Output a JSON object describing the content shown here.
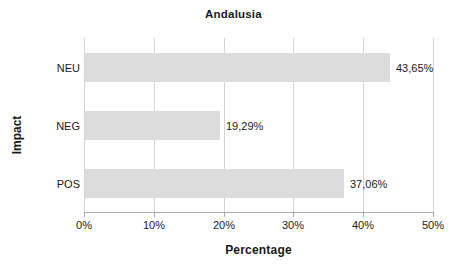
{
  "chart_data": {
    "type": "bar",
    "orientation": "horizontal",
    "title": "Andalusia",
    "xlabel": "Percentage",
    "ylabel": "Impact",
    "categories": [
      "NEU",
      "NEG",
      "POS"
    ],
    "values": [
      43.65,
      19.29,
      37.06
    ],
    "value_labels": [
      "43,65%",
      "19,29%",
      "37,06%"
    ],
    "xlim": [
      0,
      50
    ],
    "xticks": [
      0,
      10,
      20,
      30,
      40,
      50
    ],
    "xtick_labels": [
      "0%",
      "10%",
      "20%",
      "30%",
      "40%",
      "50%"
    ],
    "grid": true,
    "legend": false,
    "bar_color": "#dcdcdc",
    "axis_color": "#a9a9a9",
    "gridline_color": "#d4d4d4",
    "text_color": "#1a1a1a"
  }
}
